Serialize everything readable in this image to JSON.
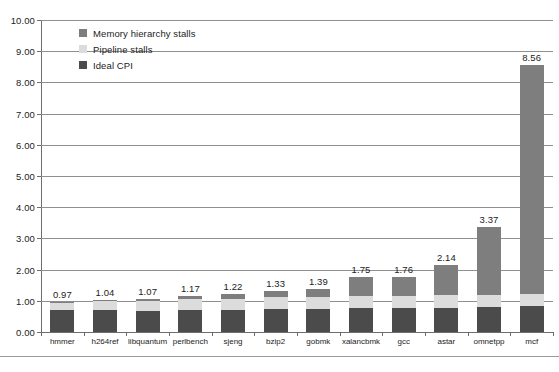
{
  "chart_data": {
    "type": "bar",
    "subtype": "stacked-bar",
    "title": "",
    "xlabel": "",
    "ylabel": "",
    "ylim": [
      0,
      10
    ],
    "ytick_step": 1,
    "grid": true,
    "legend_position": "top-left-inside",
    "categories": [
      "hmmer",
      "h264ref",
      "libquantum",
      "perlbench",
      "sjeng",
      "bzip2",
      "gobmk",
      "xalancbmk",
      "gcc",
      "astar",
      "omnetpp",
      "mcf"
    ],
    "ytick_labels": [
      "0.00",
      "1.00",
      "2.00",
      "3.00",
      "4.00",
      "5.00",
      "6.00",
      "7.00",
      "8.00",
      "9.00",
      "10.00"
    ],
    "series": [
      {
        "name": "Ideal CPI",
        "color": "#4b4b4b",
        "values": [
          0.7,
          0.7,
          0.68,
          0.72,
          0.72,
          0.74,
          0.74,
          0.76,
          0.76,
          0.78,
          0.8,
          0.82
        ]
      },
      {
        "name": "Pipeline stalls",
        "color": "#dcdcdc",
        "values": [
          0.24,
          0.28,
          0.31,
          0.33,
          0.34,
          0.37,
          0.38,
          0.38,
          0.38,
          0.4,
          0.4,
          0.4
        ]
      },
      {
        "name": "Memory hierarchy stalls",
        "color": "#7e7e7e",
        "values": [
          0.03,
          0.06,
          0.08,
          0.12,
          0.16,
          0.22,
          0.27,
          0.61,
          0.62,
          0.96,
          2.17,
          7.34
        ]
      }
    ],
    "totals": [
      0.97,
      1.04,
      1.07,
      1.17,
      1.22,
      1.33,
      1.39,
      1.75,
      1.76,
      2.14,
      3.37,
      8.56
    ],
    "value_labels": [
      "0.97",
      "1.04",
      "1.07",
      "1.17",
      "1.22",
      "1.33",
      "1.39",
      "1.75",
      "1.76",
      "2.14",
      "3.37",
      "8.56"
    ]
  },
  "legend": {
    "items": [
      {
        "label": "Memory hierarchy stalls",
        "color": "#7e7e7e"
      },
      {
        "label": "Pipeline stalls",
        "color": "#dcdcdc"
      },
      {
        "label": "Ideal CPI",
        "color": "#4b4b4b"
      }
    ]
  },
  "caption": {
    "text": ""
  }
}
